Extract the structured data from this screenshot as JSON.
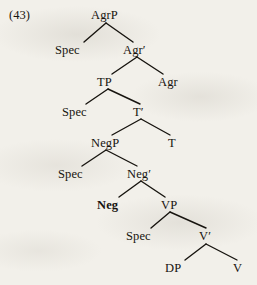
{
  "figure": {
    "kind": "x-bar-syntax-tree",
    "example_number": "(43)",
    "root": "AgrP",
    "ink_color": "#17140f",
    "paper_color": "#f2f0ea"
  },
  "nodes": [
    {
      "id": "agrp",
      "label": "AgrP",
      "x": 91,
      "y": 9,
      "bold": false
    },
    {
      "id": "spec-agrp",
      "label": "Spec",
      "x": 55,
      "y": 44,
      "bold": false
    },
    {
      "id": "agr-bar",
      "label": "Agr′",
      "x": 123,
      "y": 44,
      "bold": false
    },
    {
      "id": "tp",
      "label": "TP",
      "x": 97,
      "y": 76,
      "bold": false
    },
    {
      "id": "agr",
      "label": "Agr",
      "x": 158,
      "y": 76,
      "bold": false
    },
    {
      "id": "spec-tp",
      "label": "Spec",
      "x": 62,
      "y": 106,
      "bold": false
    },
    {
      "id": "t-bar",
      "label": "T′",
      "x": 133,
      "y": 106,
      "bold": false
    },
    {
      "id": "negp",
      "label": "NegP",
      "x": 91,
      "y": 137,
      "bold": false
    },
    {
      "id": "t",
      "label": "T",
      "x": 168,
      "y": 137,
      "bold": false
    },
    {
      "id": "spec-negp",
      "label": "Spec",
      "x": 58,
      "y": 168,
      "bold": false
    },
    {
      "id": "neg-bar",
      "label": "Neg′",
      "x": 127,
      "y": 168,
      "bold": false
    },
    {
      "id": "neg",
      "label": "Neg",
      "x": 97,
      "y": 199,
      "bold": true
    },
    {
      "id": "vp",
      "label": "VP",
      "x": 161,
      "y": 199,
      "bold": false
    },
    {
      "id": "spec-vp",
      "label": "Spec",
      "x": 126,
      "y": 230,
      "bold": false
    },
    {
      "id": "v-bar",
      "label": "V′",
      "x": 199,
      "y": 230,
      "bold": false
    },
    {
      "id": "dp",
      "label": "DP",
      "x": 165,
      "y": 262,
      "bold": false
    },
    {
      "id": "v",
      "label": "V",
      "x": 233,
      "y": 262,
      "bold": false
    }
  ],
  "branches": [
    {
      "parent": "agrp",
      "apex_x": 106,
      "apex_y": 23,
      "left_x": 84,
      "left_y": 42,
      "right_x": 133,
      "right_y": 42
    },
    {
      "parent": "agr-bar",
      "apex_x": 137,
      "apex_y": 57,
      "left_x": 112,
      "left_y": 74,
      "right_x": 163,
      "right_y": 74
    },
    {
      "parent": "tp",
      "apex_x": 108,
      "apex_y": 89,
      "left_x": 86,
      "left_y": 104,
      "right_x": 140,
      "right_y": 104
    },
    {
      "parent": "t-bar",
      "apex_x": 141,
      "apex_y": 119,
      "left_x": 112,
      "left_y": 135,
      "right_x": 170,
      "right_y": 135
    },
    {
      "parent": "negp",
      "apex_x": 106,
      "apex_y": 150,
      "left_x": 82,
      "left_y": 166,
      "right_x": 137,
      "right_y": 166
    },
    {
      "parent": "neg-bar",
      "apex_x": 141,
      "apex_y": 181,
      "left_x": 119,
      "left_y": 197,
      "right_x": 165,
      "right_y": 197
    },
    {
      "parent": "vp",
      "apex_x": 170,
      "apex_y": 212,
      "left_x": 151,
      "left_y": 228,
      "right_x": 206,
      "right_y": 228
    },
    {
      "parent": "v-bar",
      "apex_x": 206,
      "apex_y": 244,
      "left_x": 185,
      "left_y": 260,
      "right_x": 237,
      "right_y": 260
    }
  ]
}
